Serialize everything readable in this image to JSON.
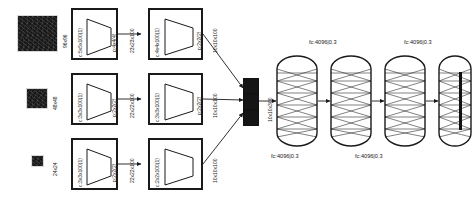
{
  "diagram": {
    "ink_color": "#1a1a1a",
    "patch_color": "#171717"
  },
  "inputs": [
    {
      "name": "input-patch-large",
      "size_label": "96x96"
    },
    {
      "name": "input-patch-medium",
      "size_label": "48x48"
    },
    {
      "name": "input-patch-small",
      "size_label": "24x24"
    }
  ],
  "streams": [
    {
      "name": "stream-96",
      "stages": [
        {
          "conv": "c:5x5x100(1)",
          "pool": "p:4x4(4)"
        },
        {
          "conv": "c:4x4x100(1)",
          "pool": "p:2x2(2)"
        }
      ],
      "arrow_label": "23x23x100",
      "output_label": "10x10x100"
    },
    {
      "name": "stream-48",
      "stages": [
        {
          "conv": "c:3x3x100(1)",
          "pool": "p:2x2(2)"
        },
        {
          "conv": "c:3x3x100(1)",
          "pool": "p:2x2(2)"
        }
      ],
      "arrow_label": "22x22x100",
      "output_label": "10x10x100"
    },
    {
      "name": "stream-24",
      "stages": [
        {
          "conv": "c:3x3x100(1)",
          "pool": "p:2x2(2)"
        },
        {
          "conv": "c:2x2x100(1)",
          "pool": ""
        }
      ],
      "arrow_label": "22x22x100",
      "output_label": "10x10x100"
    }
  ],
  "concat": {
    "name": "feature-concatenation",
    "output_label": "10x10x300",
    "segments": 3
  },
  "fc_layers": [
    {
      "name": "fc-1",
      "label": "fc:4096|0.3",
      "label_position": "below"
    },
    {
      "name": "fc-2",
      "label": "fc:4096|0.3",
      "label_position": "above"
    },
    {
      "name": "fc-3",
      "label": "fc:4096|0.3",
      "label_position": "below"
    },
    {
      "name": "fc-4",
      "label": "fc:4096|0.3",
      "label_position": "above"
    }
  ],
  "output": {
    "name": "output-layer",
    "label": ""
  }
}
